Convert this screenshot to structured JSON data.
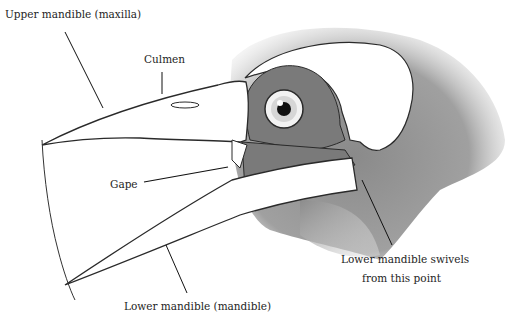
{
  "diagram": {
    "colors": {
      "background": "#ffffff",
      "bone": "#ffffff",
      "outline": "#2a2a2a",
      "skin_dark": "#7c7c7c",
      "feathers": "#9a9a9a",
      "leader_line": "#111111"
    },
    "labels": {
      "upper_mandible": "Upper mandible (maxilla)",
      "culmen": "Culmen",
      "gape": "Gape",
      "lower_mandible": "Lower mandible (mandible)",
      "swivel_line1": "Lower mandible swivels",
      "swivel_line2": "from this point"
    }
  }
}
